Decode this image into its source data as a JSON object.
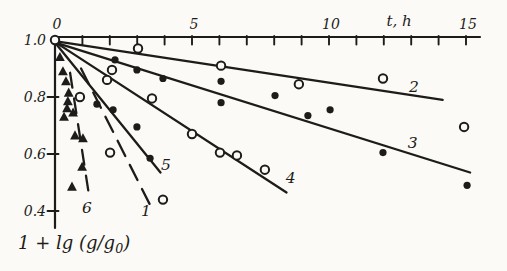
{
  "figure": {
    "background": "#fbfaf6",
    "ink": "#1d1c1a"
  },
  "chart_data": {
    "type": "scatter",
    "title": "",
    "xlabel": "t, h",
    "ylabel": "1 + lg (g/g₀)",
    "xlim": [
      0,
      15.5
    ],
    "ylim": [
      0.35,
      1.0
    ],
    "grid": false,
    "legend": "none (curves numbered inline)",
    "x_ticks": [
      {
        "value": 0,
        "label": "0"
      },
      {
        "value": 5,
        "label": "5"
      },
      {
        "value": 10,
        "label": "10"
      },
      {
        "value": 15,
        "label": "15"
      }
    ],
    "x_minor_ticks": {
      "from": 1,
      "to": 15,
      "step": 1
    },
    "y_ticks": [
      {
        "value": 1.0,
        "label": "1.0",
        "tick": false
      },
      {
        "value": 0.8,
        "label": "0.8",
        "tick": true
      },
      {
        "value": 0.6,
        "label": "0.6",
        "tick": true
      },
      {
        "value": 0.4,
        "label": "0.4",
        "tick": true
      }
    ],
    "series": [
      {
        "name": "1",
        "marker": "open-circle",
        "line_style": "dashed",
        "dash": "17 10",
        "trend_line": [
          [
            0.95,
            0.9
          ],
          [
            3.45,
            0.425
          ]
        ],
        "label_at": [
          3.32,
          0.4
        ],
        "points": [
          [
            0.91,
            0.8
          ],
          [
            2.01,
            0.605
          ],
          [
            3.94,
            0.44
          ]
        ]
      },
      {
        "name": "2",
        "marker": "open-circle",
        "line_style": "solid",
        "trend_line": [
          [
            0.05,
            0.995
          ],
          [
            14.15,
            0.79
          ]
        ],
        "label_at": [
          13.1,
          0.835
        ],
        "points": [
          [
            0.0,
            1.0
          ],
          [
            3.03,
            0.97
          ],
          [
            6.06,
            0.91
          ],
          [
            8.9,
            0.845
          ],
          [
            11.97,
            0.865
          ],
          [
            14.93,
            0.695
          ]
        ]
      },
      {
        "name": "3",
        "marker": "filled-circle",
        "line_style": "solid",
        "trend_line": [
          [
            0.05,
            0.99
          ],
          [
            15.15,
            0.535
          ]
        ],
        "label_at": [
          13.05,
          0.64
        ],
        "points": [
          [
            2.19,
            0.93
          ],
          [
            2.99,
            0.895
          ],
          [
            3.94,
            0.865
          ],
          [
            6.06,
            0.855
          ],
          [
            6.06,
            0.78
          ],
          [
            8.03,
            0.805
          ],
          [
            9.23,
            0.735
          ],
          [
            10.04,
            0.755
          ],
          [
            11.97,
            0.605
          ],
          [
            15.04,
            0.49
          ]
        ]
      },
      {
        "name": "4",
        "marker": "open-circle",
        "line_style": "solid",
        "trend_line": [
          [
            0.05,
            0.99
          ],
          [
            8.45,
            0.465
          ]
        ],
        "label_at": [
          8.6,
          0.515
        ],
        "points": [
          [
            1.9,
            0.86
          ],
          [
            2.08,
            0.895
          ],
          [
            3.54,
            0.795
          ],
          [
            5.0,
            0.67
          ],
          [
            6.02,
            0.605
          ],
          [
            6.64,
            0.595
          ],
          [
            7.66,
            0.545
          ]
        ]
      },
      {
        "name": "5",
        "marker": "filled-circle",
        "line_style": "solid",
        "trend_line": [
          [
            0.05,
            0.985
          ],
          [
            3.85,
            0.535
          ]
        ],
        "label_at": [
          4.05,
          0.56
        ],
        "points": [
          [
            1.53,
            0.775
          ],
          [
            2.12,
            0.755
          ],
          [
            2.99,
            0.695
          ],
          [
            3.47,
            0.585
          ]
        ]
      },
      {
        "name": "6",
        "marker": "filled-triangle",
        "line_style": "dashed",
        "dash": "15 11",
        "trend_line": [
          [
            0.55,
            0.885
          ],
          [
            1.25,
            0.45
          ]
        ],
        "label_at": [
          1.17,
          0.41
        ],
        "points": [
          [
            0.18,
            0.94
          ],
          [
            0.29,
            0.89
          ],
          [
            0.4,
            0.855
          ],
          [
            0.5,
            0.815
          ],
          [
            0.47,
            0.785
          ],
          [
            0.44,
            0.76
          ],
          [
            0.66,
            0.745
          ],
          [
            0.33,
            0.73
          ],
          [
            0.73,
            0.665
          ],
          [
            1.02,
            0.655
          ],
          [
            0.99,
            0.555
          ],
          [
            0.62,
            0.485
          ]
        ]
      }
    ]
  }
}
